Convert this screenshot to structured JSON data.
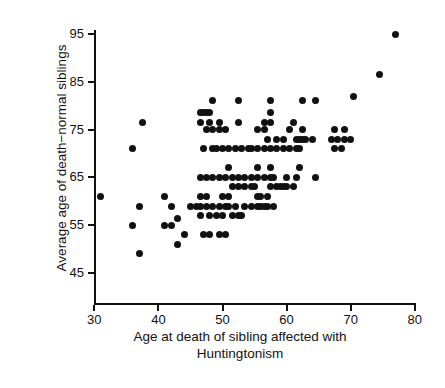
{
  "chart_data": {
    "type": "scatter",
    "title": "",
    "subtitle": "",
    "xlabel": "Age at death of sibling affected with Huntingtonism",
    "xlabel_line1": "Age at death of sibling affected with",
    "xlabel_line2": "Huntingtonism",
    "ylabel": "Average age of death−normal siblings",
    "xlim": [
      27,
      82
    ],
    "ylim": [
      43,
      97
    ],
    "xticks": [
      30,
      40,
      50,
      60,
      70,
      80
    ],
    "xticklabels": [
      "30",
      "40",
      "50",
      "60",
      "70",
      "80"
    ],
    "yticks": [
      45,
      55,
      65,
      75,
      85,
      95
    ],
    "yticklabels": [
      "45",
      "55",
      "65",
      "75",
      "85",
      "95"
    ],
    "grid": false,
    "legend": null,
    "marker": "filled-circle",
    "marker_color": "#111111",
    "marker_size_px": 7,
    "point_count": 139,
    "points": [
      [
        31,
        61
      ],
      [
        36,
        55
      ],
      [
        36,
        71
      ],
      [
        37,
        59
      ],
      [
        37,
        49
      ],
      [
        37.5,
        76.5
      ],
      [
        41,
        61
      ],
      [
        41,
        55
      ],
      [
        42,
        59
      ],
      [
        42,
        55
      ],
      [
        43,
        51
      ],
      [
        43,
        56.5
      ],
      [
        44,
        53
      ],
      [
        45,
        59
      ],
      [
        46,
        59
      ],
      [
        46.5,
        78.5
      ],
      [
        47,
        78.5
      ],
      [
        47.5,
        78.5
      ],
      [
        48,
        78.5
      ],
      [
        46.5,
        76.5
      ],
      [
        48,
        76.5
      ],
      [
        49.5,
        76.5
      ],
      [
        47.5,
        75
      ],
      [
        48.5,
        75
      ],
      [
        49.5,
        75
      ],
      [
        50.5,
        75
      ],
      [
        48.5,
        81
      ],
      [
        47,
        71
      ],
      [
        48.5,
        71
      ],
      [
        46.5,
        65
      ],
      [
        47.5,
        65
      ],
      [
        48.5,
        65
      ],
      [
        49.5,
        65
      ],
      [
        50.5,
        65
      ],
      [
        51.5,
        65
      ],
      [
        46.5,
        61
      ],
      [
        47.5,
        61
      ],
      [
        46.5,
        59
      ],
      [
        47.5,
        59
      ],
      [
        48.5,
        59
      ],
      [
        49.5,
        59
      ],
      [
        50.5,
        59
      ],
      [
        46.5,
        57
      ],
      [
        48,
        57
      ],
      [
        49,
        57
      ],
      [
        50,
        57
      ],
      [
        48,
        53
      ],
      [
        51,
        59
      ],
      [
        51,
        61
      ],
      [
        51,
        67
      ],
      [
        51.5,
        63
      ],
      [
        52.5,
        63
      ],
      [
        53.5,
        63
      ],
      [
        54.5,
        63
      ],
      [
        55,
        63
      ],
      [
        52,
        71
      ],
      [
        53,
        71
      ],
      [
        54,
        71
      ],
      [
        52.5,
        76.5
      ],
      [
        52.5,
        81
      ],
      [
        52.5,
        65
      ],
      [
        53.5,
        59
      ],
      [
        54.5,
        59
      ],
      [
        54.5,
        65
      ],
      [
        55.5,
        65
      ],
      [
        55.5,
        59
      ],
      [
        55.5,
        61
      ],
      [
        55.5,
        67
      ],
      [
        55.5,
        71
      ],
      [
        56.5,
        71
      ],
      [
        56.5,
        76.5
      ],
      [
        55.5,
        75
      ],
      [
        56.5,
        75
      ],
      [
        56,
        59
      ],
      [
        57,
        59
      ],
      [
        57,
        61
      ],
      [
        57.5,
        63
      ],
      [
        57.5,
        65
      ],
      [
        57.5,
        67
      ],
      [
        57.5,
        71
      ],
      [
        58.5,
        71
      ],
      [
        58,
        59
      ],
      [
        57.5,
        76.5
      ],
      [
        57.5,
        78.5
      ],
      [
        57.5,
        81
      ],
      [
        58.5,
        73
      ],
      [
        59.5,
        73
      ],
      [
        59.5,
        71
      ],
      [
        60.5,
        71
      ],
      [
        60,
        63
      ],
      [
        61,
        63
      ],
      [
        60,
        65
      ],
      [
        60.5,
        75
      ],
      [
        61,
        76.5
      ],
      [
        61.5,
        71
      ],
      [
        62,
        71
      ],
      [
        61.5,
        73
      ],
      [
        62,
        73
      ],
      [
        62.5,
        73
      ],
      [
        62.5,
        75
      ],
      [
        62.5,
        81
      ],
      [
        62,
        67
      ],
      [
        63,
        73
      ],
      [
        64,
        73
      ],
      [
        64.5,
        81
      ],
      [
        64.5,
        65
      ],
      [
        67.5,
        75
      ],
      [
        69,
        75
      ],
      [
        67,
        73
      ],
      [
        68,
        73
      ],
      [
        69,
        73
      ],
      [
        70,
        73
      ],
      [
        67.5,
        71
      ],
      [
        68.5,
        71
      ],
      [
        70.5,
        82
      ],
      [
        74.5,
        86.5
      ],
      [
        77,
        95
      ],
      [
        52,
        59
      ],
      [
        53,
        57
      ],
      [
        50.5,
        53
      ],
      [
        56.5,
        59
      ],
      [
        58.5,
        63
      ],
      [
        59,
        63
      ],
      [
        59.5,
        63
      ],
      [
        53.5,
        65
      ],
      [
        54.5,
        71
      ],
      [
        49,
        71
      ],
      [
        50,
        71
      ],
      [
        51,
        71
      ],
      [
        56.5,
        65
      ],
      [
        57,
        73
      ],
      [
        58,
        65
      ],
      [
        61.5,
        65
      ],
      [
        49.5,
        53
      ],
      [
        47,
        53
      ],
      [
        51.5,
        57
      ],
      [
        52.5,
        57
      ],
      [
        50,
        61
      ],
      [
        56,
        61
      ]
    ]
  }
}
